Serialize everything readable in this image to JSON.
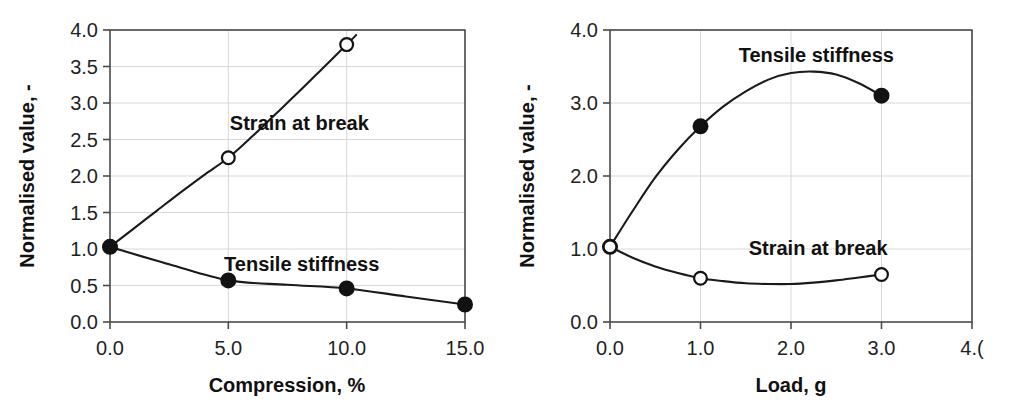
{
  "figure": {
    "background_color": "#ffffff",
    "line_color": "#1a1a1a",
    "grid_color": "#d8d8d8",
    "panel_count": 2
  },
  "chart_data": [
    {
      "type": "line",
      "panel": "left",
      "title": "",
      "xlabel": "Compression, %",
      "ylabel": "Normalised value, -",
      "xlim": [
        0.0,
        15.0
      ],
      "ylim": [
        0.0,
        4.0
      ],
      "xticks": [
        0.0,
        5.0,
        10.0,
        15.0
      ],
      "xtick_labels": [
        "0.0",
        "5.0",
        "10.0",
        "15.0"
      ],
      "yticks": [
        0.0,
        0.5,
        1.0,
        1.5,
        2.0,
        2.5,
        3.0,
        3.5,
        4.0
      ],
      "ytick_labels": [
        "0.0",
        "0.5",
        "1.0",
        "1.5",
        "2.0",
        "2.5",
        "3.0",
        "3.5",
        "4.0"
      ],
      "grid": true,
      "grid_axes": "both",
      "legend_position": "inline-annotations",
      "series": [
        {
          "name": "Strain at break",
          "marker": "open-circle",
          "annotation": "Strain at break",
          "annotation_x": 8.0,
          "annotation_y": 2.72,
          "x": [
            0.0,
            5.0,
            10.0
          ],
          "values": [
            1.03,
            2.25,
            3.8
          ],
          "curve_x": [
            0.0,
            1.0,
            2.0,
            3.0,
            4.0,
            5.0,
            6.0,
            7.0,
            8.0,
            9.0,
            10.0,
            10.4
          ],
          "curve_y": [
            1.03,
            1.28,
            1.53,
            1.78,
            2.02,
            2.25,
            2.54,
            2.85,
            3.16,
            3.48,
            3.8,
            3.93
          ],
          "note": "curve continues beyond top of axis"
        },
        {
          "name": "Tensile stiffness",
          "marker": "filled-circle",
          "annotation": "Tensile stiffness",
          "annotation_x": 8.1,
          "annotation_y": 0.8,
          "x": [
            0.0,
            5.0,
            10.0,
            15.0
          ],
          "values": [
            1.03,
            0.57,
            0.46,
            0.24
          ],
          "curve_x": [
            0.0,
            2.5,
            5.0,
            7.5,
            10.0,
            12.5,
            15.0
          ],
          "curve_y": [
            1.03,
            0.79,
            0.57,
            0.51,
            0.46,
            0.35,
            0.24
          ]
        }
      ]
    },
    {
      "type": "line",
      "panel": "right",
      "title": "",
      "xlabel": "Load, g",
      "ylabel": "Normalised value, -",
      "xlim": [
        0.0,
        4.0
      ],
      "ylim": [
        0.0,
        4.0
      ],
      "xticks": [
        0.0,
        1.0,
        2.0,
        3.0,
        4.0
      ],
      "xtick_labels": [
        "0.0",
        "1.0",
        "2.0",
        "3.0",
        "4.("
      ],
      "yticks": [
        0.0,
        1.0,
        2.0,
        3.0,
        4.0
      ],
      "ytick_labels": [
        "0.0",
        "1.0",
        "2.0",
        "3.0",
        "4.0"
      ],
      "grid": true,
      "grid_axes": "both",
      "legend_position": "inline-annotations",
      "series": [
        {
          "name": "Tensile stiffness",
          "marker": "filled-circle",
          "annotation": "Tensile stiffness",
          "annotation_x": 2.28,
          "annotation_y": 3.66,
          "x": [
            0.0,
            1.0,
            3.0
          ],
          "values": [
            1.03,
            2.68,
            3.1
          ],
          "curve_x": [
            0.0,
            0.25,
            0.5,
            0.75,
            1.0,
            1.25,
            1.5,
            1.75,
            2.0,
            2.25,
            2.5,
            2.75,
            3.0
          ],
          "curve_y": [
            1.03,
            1.52,
            1.98,
            2.36,
            2.68,
            2.95,
            3.16,
            3.32,
            3.41,
            3.43,
            3.39,
            3.27,
            3.1
          ]
        },
        {
          "name": "Strain at break",
          "marker": "open-circle",
          "annotation": "Strain at break",
          "annotation_x": 2.3,
          "annotation_y": 1.02,
          "x": [
            0.0,
            1.0,
            3.0
          ],
          "values": [
            1.03,
            0.6,
            0.65
          ],
          "curve_x": [
            0.0,
            0.25,
            0.5,
            0.75,
            1.0,
            1.25,
            1.5,
            1.75,
            2.0,
            2.25,
            2.5,
            2.75,
            3.0
          ],
          "curve_y": [
            1.03,
            0.88,
            0.76,
            0.67,
            0.6,
            0.56,
            0.53,
            0.52,
            0.52,
            0.54,
            0.57,
            0.61,
            0.65
          ]
        }
      ]
    }
  ]
}
